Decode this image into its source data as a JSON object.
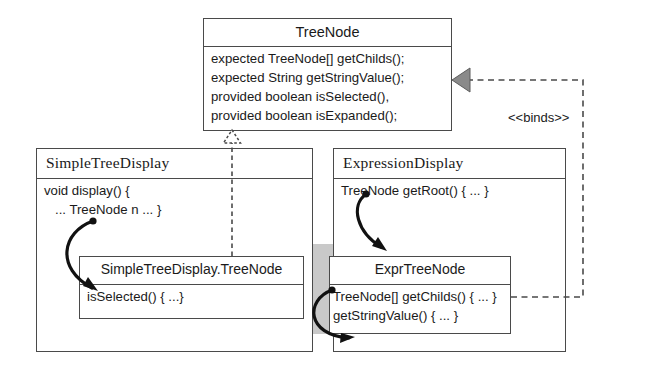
{
  "diagram": {
    "type": "uml-class-diagram",
    "colors": {
      "background": "#ffffff",
      "line": "#4a4a4a",
      "gray_band": "#c9c9c9",
      "arrowhead_fill": "#8a8a8a",
      "text": "#1a1a1a"
    }
  },
  "tree_node": {
    "name": "TreeNode",
    "members": [
      "expected TreeNode[] getChilds();",
      "expected String getStringValue();",
      "provided boolean isSelected(),",
      "provided boolean isExpanded();"
    ]
  },
  "simple_tree_display": {
    "name": "SimpleTreeDisplay",
    "members": [
      "void display() {",
      "   ... TreeNode n ... }"
    ],
    "inner_class": {
      "name": "SimpleTreeDisplay.TreeNode",
      "members": [
        "isSelected() { ...}"
      ]
    }
  },
  "expression_display": {
    "name": "ExpressionDisplay",
    "members": [
      "TreeNode getRoot() { ... }"
    ],
    "inner_class": {
      "name": "ExprTreeNode",
      "members": [
        "TreeNode[] getChilds() { ... }",
        "getStringValue() { ... }"
      ]
    }
  },
  "relations": {
    "binds_label": "<<binds>>",
    "generalization": "dotted-hollow-triangle",
    "binds_arrow": "dashed-solid-triangle"
  }
}
